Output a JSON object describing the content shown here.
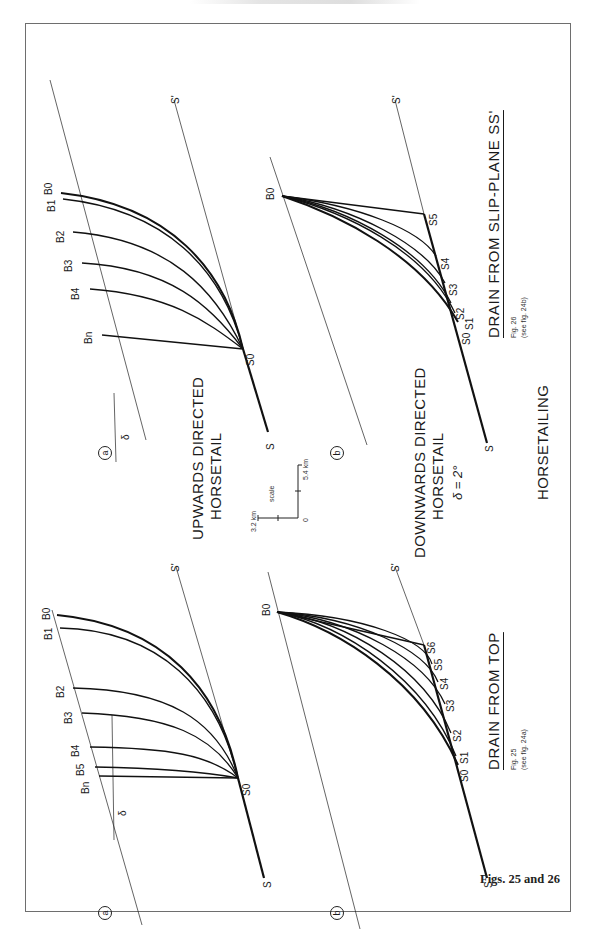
{
  "page": {
    "figure_caption": "Figs. 25 and 26",
    "main_title": "HORSETAILING"
  },
  "center": {
    "upwards_title_line1": "UPWARDS DIRECTED",
    "upwards_title_line2": "HORSETAIL",
    "downwards_title_line1": "DOWNWARDS DIRECTED",
    "downwards_title_line2": "HORSETAIL",
    "delta_value": "δ = 2°",
    "scale": {
      "label": "scale",
      "origin": "0",
      "horizontal": "3.2 km",
      "vertical": "5.4 km"
    }
  },
  "fig25": {
    "title": "DRAIN FROM TOP",
    "fig_number": "Fig. 25",
    "see_ref": "(see fig. 24a)",
    "panel_a": {
      "marker": "a",
      "delta_symbol": "δ",
      "slip_start": "S",
      "slip_end": "S'",
      "fault_point": "S0",
      "b_labels": [
        "B0",
        "B1",
        "B2",
        "B3",
        "B4",
        "B5",
        "Bn"
      ]
    },
    "panel_b": {
      "marker": "b",
      "slip_start": "S",
      "slip_end": "S'",
      "top_point": "B0",
      "s_labels": [
        "S0",
        "S1",
        "S2",
        "S3",
        "S4",
        "S5",
        "S6"
      ]
    }
  },
  "fig26": {
    "title": "DRAIN FROM SLIP-PLANE SS'",
    "fig_number": "Fig. 26",
    "see_ref": "(see fig. 24b)",
    "panel_a": {
      "marker": "a",
      "delta_symbol": "δ",
      "slip_start": "S",
      "slip_end": "S'",
      "fault_point": "S0",
      "b_labels": [
        "B0",
        "B1",
        "B2",
        "B3",
        "B4",
        "Bn"
      ]
    },
    "panel_b": {
      "marker": "b",
      "slip_start": "S",
      "slip_end": "S'",
      "top_point": "B0",
      "s_labels": [
        "S0",
        "S1",
        "S2",
        "S3",
        "S4",
        "S5"
      ]
    }
  }
}
